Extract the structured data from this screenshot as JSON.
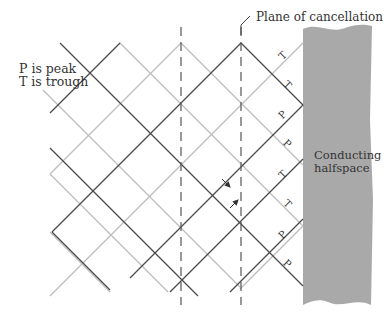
{
  "labels": {
    "legend_line1": "P is peak",
    "legend_line2": "T is trough",
    "plane": "Plane of cancellation",
    "conductor_line1": "Conducting",
    "conductor_line2": "halfspace"
  },
  "colors": {
    "dark_line": "#4a4a4a",
    "light_line": "#bdbdbd",
    "dashed_line": "#555555",
    "conductor_fill": "#a9a9a9",
    "text": "#333333"
  },
  "dashed_lines_x": [
    181,
    241
  ],
  "dark_lines": [
    [
      60,
      43,
      303,
      286
    ],
    [
      120,
      43,
      50,
      113
    ],
    [
      241,
      43,
      52,
      232
    ],
    [
      50,
      148,
      198,
      296
    ],
    [
      241,
      43,
      303,
      105
    ],
    [
      230,
      292,
      303,
      219
    ],
    [
      52,
      232,
      110,
      290
    ],
    [
      170,
      292,
      303,
      159
    ],
    [
      303,
      159,
      303,
      159
    ],
    [
      303,
      105,
      130,
      278
    ]
  ],
  "light_lines": [
    [
      120,
      43,
      303,
      226
    ],
    [
      181,
      43,
      50,
      174
    ],
    [
      43,
      90,
      240,
      287
    ],
    [
      303,
      43,
      50,
      296
    ],
    [
      181,
      43,
      303,
      165
    ],
    [
      110,
      292,
      50,
      232
    ],
    [
      303,
      226,
      240,
      289
    ],
    [
      50,
      174,
      168,
      292
    ]
  ],
  "markers": [
    {
      "text": "T",
      "x": 285,
      "y": 58,
      "rot": -45
    },
    {
      "text": "T",
      "x": 285,
      "y": 87,
      "rot": 45
    },
    {
      "text": "P",
      "x": 285,
      "y": 117,
      "rot": -45
    },
    {
      "text": "P",
      "x": 285,
      "y": 146,
      "rot": 45
    },
    {
      "text": "T",
      "x": 285,
      "y": 177,
      "rot": -45
    },
    {
      "text": "T",
      "x": 285,
      "y": 206,
      "rot": 45
    },
    {
      "text": "P",
      "x": 285,
      "y": 237,
      "rot": -45
    },
    {
      "text": "P",
      "x": 285,
      "y": 266,
      "rot": 45
    }
  ],
  "arrows": [
    {
      "x1": 222,
      "y1": 179,
      "x2": 230,
      "y2": 187
    },
    {
      "x1": 230,
      "y1": 208,
      "x2": 238,
      "y2": 200
    }
  ]
}
